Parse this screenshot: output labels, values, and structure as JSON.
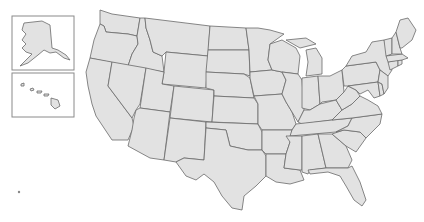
{
  "map": {
    "type": "blank-outline",
    "region": "United States",
    "colors": {
      "fill": "#e2e2e2",
      "stroke": "#6a6a6a",
      "background": "#ffffff",
      "inset_border": "#8a8a8a"
    },
    "insets": [
      {
        "name": "Alaska"
      },
      {
        "name": "Hawaii"
      }
    ],
    "states": [
      "Washington",
      "Oregon",
      "California",
      "Idaho",
      "Nevada",
      "Montana",
      "Wyoming",
      "Utah",
      "Arizona",
      "Colorado",
      "New Mexico",
      "North Dakota",
      "South Dakota",
      "Nebraska",
      "Kansas",
      "Oklahoma",
      "Texas",
      "Minnesota",
      "Iowa",
      "Missouri",
      "Arkansas",
      "Louisiana",
      "Wisconsin",
      "Illinois",
      "Michigan",
      "Indiana",
      "Ohio",
      "Kentucky",
      "Tennessee",
      "Mississippi",
      "Alabama",
      "Georgia",
      "Florida",
      "South Carolina",
      "North Carolina",
      "Virginia",
      "West Virginia",
      "Pennsylvania",
      "New York",
      "Maryland",
      "Delaware",
      "New Jersey",
      "Connecticut",
      "Rhode Island",
      "Massachusetts",
      "Vermont",
      "New Hampshire",
      "Maine",
      "Alaska",
      "Hawaii"
    ]
  }
}
